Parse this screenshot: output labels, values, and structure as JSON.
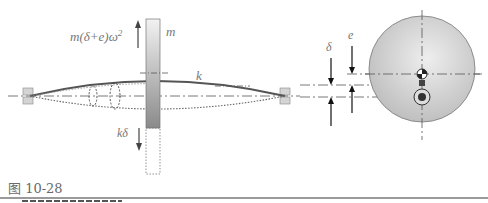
{
  "figure": {
    "caption": "图 10-28",
    "labels": {
      "centrifugal_force": "m(δ+e)ω²",
      "centrifugal_force_base": "m(δ+e)ω",
      "centrifugal_force_exp": "2",
      "mass": "m",
      "stiffness": "k",
      "spring_force": "kδ",
      "deflection": "δ",
      "eccentricity": "e"
    },
    "colors": {
      "shaft": "#555555",
      "disk_fill": "#c8c8c8",
      "bearing_fill": "#d4d4d4",
      "label": "#777777",
      "arrow": "#333333"
    }
  }
}
